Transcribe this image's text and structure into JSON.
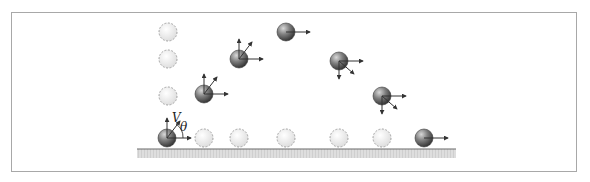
{
  "figure": {
    "labels": {
      "velocity": "V",
      "angle": "θ"
    },
    "colors": {
      "frame": "#a8a8a8",
      "ground": "#6a6a6a",
      "ground_fill": "#d9d9d9",
      "ball_dark": "#555555",
      "ball_ghost": "#e6e6e6",
      "arrow": "#333333"
    },
    "ground": {
      "x1": 137,
      "x2": 456,
      "y": 149
    },
    "balls": [
      {
        "x": 167,
        "y": 138,
        "type": "solid",
        "arrows": [
          "up",
          "diag-up",
          "right"
        ]
      },
      {
        "x": 204,
        "y": 94,
        "type": "solid",
        "arrows": [
          "up",
          "diag-up",
          "right"
        ]
      },
      {
        "x": 239,
        "y": 59,
        "type": "solid",
        "arrows": [
          "up",
          "diag-up",
          "right"
        ]
      },
      {
        "x": 286,
        "y": 32,
        "type": "solid",
        "arrows": [
          "right"
        ]
      },
      {
        "x": 339,
        "y": 61,
        "type": "solid",
        "arrows": [
          "right",
          "diag-down",
          "down"
        ]
      },
      {
        "x": 382,
        "y": 96,
        "type": "solid",
        "arrows": [
          "right",
          "diag-down",
          "down"
        ]
      },
      {
        "x": 424,
        "y": 138,
        "type": "solid",
        "arrows": [
          "right"
        ]
      }
    ],
    "ghosts_vertical": [
      {
        "x": 168,
        "y": 32
      },
      {
        "x": 168,
        "y": 59
      },
      {
        "x": 168,
        "y": 96
      }
    ],
    "ghosts_horizontal": [
      {
        "x": 204,
        "y": 138
      },
      {
        "x": 239,
        "y": 138
      },
      {
        "x": 286,
        "y": 138
      },
      {
        "x": 339,
        "y": 138
      },
      {
        "x": 382,
        "y": 138
      }
    ]
  }
}
